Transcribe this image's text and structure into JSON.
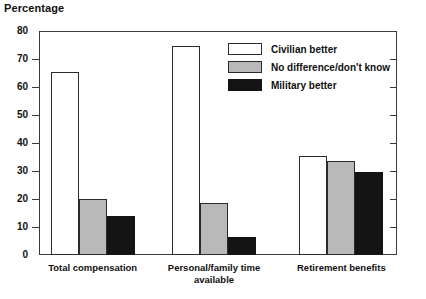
{
  "chart_data": {
    "type": "bar",
    "title": "Percentage",
    "xlabel": "",
    "ylabel": "",
    "ylim": [
      0,
      80
    ],
    "yticks": [
      0,
      10,
      20,
      30,
      40,
      50,
      60,
      70,
      80
    ],
    "grid": false,
    "legend_position": "inside-upper-right",
    "categories": [
      "Total compensation",
      "Personal/family time available",
      "Retirement benefits"
    ],
    "category_label_lines": [
      [
        "Total compensation"
      ],
      [
        "Personal/family time",
        "available"
      ],
      [
        "Retirement benefits"
      ]
    ],
    "series": [
      {
        "name": "Civilian better",
        "color": "#ffffff",
        "values": [
          65.5,
          74.5,
          35.5
        ]
      },
      {
        "name": "No difference/don't know",
        "color": "#b9b9b9",
        "values": [
          20.0,
          18.5,
          33.5
        ]
      },
      {
        "name": "Military better",
        "color": "#141414",
        "values": [
          14.0,
          6.5,
          29.5
        ]
      }
    ]
  },
  "legend": {
    "items": [
      {
        "label": "Civilian better",
        "swatch": "white"
      },
      {
        "label": "No difference/don't know",
        "swatch": "gray"
      },
      {
        "label": "Military better",
        "swatch": "black"
      }
    ]
  },
  "axis": {
    "y_tick_labels": [
      "80",
      "70",
      "60",
      "50",
      "40",
      "30",
      "20",
      "10",
      "0"
    ]
  }
}
